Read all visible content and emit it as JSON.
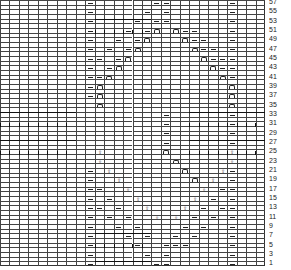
{
  "chart": {
    "columns": 28,
    "rows": 57,
    "row_labels": [
      "1",
      "3",
      "5",
      "7",
      "9",
      "11",
      "13",
      "15",
      "17",
      "19",
      "21",
      "23",
      "25",
      "27",
      "29",
      "31",
      "33",
      "35",
      "37",
      "39",
      "41",
      "43",
      "45",
      "47",
      "49",
      "51",
      "53",
      "55",
      "57"
    ],
    "legend_symbols": {
      "p": "purl-dash",
      "u": "arch-symbol",
      "t": "twist-arrow-symbol",
      "c": "cable-crossing"
    },
    "cells": [
      {
        "r": 57,
        "c": 9,
        "s": "p"
      },
      {
        "r": 57,
        "c": 16,
        "s": "p"
      },
      {
        "r": 57,
        "c": 17,
        "s": "p"
      },
      {
        "r": 57,
        "c": 24,
        "s": "p"
      },
      {
        "r": 55,
        "c": 9,
        "s": "p"
      },
      {
        "r": 55,
        "c": 15,
        "s": "p"
      },
      {
        "r": 55,
        "c": 17,
        "s": "p"
      },
      {
        "r": 55,
        "c": 24,
        "s": "p"
      },
      {
        "r": 53,
        "c": 9,
        "s": "p"
      },
      {
        "r": 53,
        "c": 14,
        "s": "p"
      },
      {
        "r": 53,
        "c": 16,
        "s": "p"
      },
      {
        "r": 53,
        "c": 17,
        "s": "p"
      },
      {
        "r": 53,
        "c": 24,
        "s": "p"
      },
      {
        "r": 51,
        "c": 9,
        "s": "p"
      },
      {
        "r": 51,
        "c": 13,
        "s": "p"
      },
      {
        "r": 51,
        "c": 15,
        "s": "p"
      },
      {
        "r": 51,
        "c": 16,
        "s": "u"
      },
      {
        "r": 51,
        "c": 18,
        "s": "u"
      },
      {
        "r": 51,
        "c": 19,
        "s": "p"
      },
      {
        "r": 51,
        "c": 20,
        "s": "p"
      },
      {
        "r": 51,
        "c": 24,
        "s": "p"
      },
      {
        "r": 49,
        "c": 9,
        "s": "p"
      },
      {
        "r": 49,
        "c": 12,
        "s": "p"
      },
      {
        "r": 49,
        "c": 14,
        "s": "p"
      },
      {
        "r": 49,
        "c": 15,
        "s": "u"
      },
      {
        "r": 49,
        "c": 19,
        "s": "u"
      },
      {
        "r": 49,
        "c": 20,
        "s": "p"
      },
      {
        "r": 49,
        "c": 21,
        "s": "p"
      },
      {
        "r": 49,
        "c": 24,
        "s": "p"
      },
      {
        "r": 47,
        "c": 9,
        "s": "p"
      },
      {
        "r": 47,
        "c": 11,
        "s": "p"
      },
      {
        "r": 47,
        "c": 13,
        "s": "p"
      },
      {
        "r": 47,
        "c": 14,
        "s": "u"
      },
      {
        "r": 47,
        "c": 20,
        "s": "u"
      },
      {
        "r": 47,
        "c": 21,
        "s": "p"
      },
      {
        "r": 47,
        "c": 22,
        "s": "p"
      },
      {
        "r": 47,
        "c": 24,
        "s": "p"
      },
      {
        "r": 45,
        "c": 9,
        "s": "p"
      },
      {
        "r": 45,
        "c": 10,
        "s": "p"
      },
      {
        "r": 45,
        "c": 12,
        "s": "p"
      },
      {
        "r": 45,
        "c": 13,
        "s": "u"
      },
      {
        "r": 45,
        "c": 21,
        "s": "u"
      },
      {
        "r": 45,
        "c": 22,
        "s": "p"
      },
      {
        "r": 45,
        "c": 23,
        "s": "p"
      },
      {
        "r": 45,
        "c": 24,
        "s": "p"
      },
      {
        "r": 43,
        "c": 9,
        "s": "p"
      },
      {
        "r": 43,
        "c": 11,
        "s": "p"
      },
      {
        "r": 43,
        "c": 12,
        "s": "u"
      },
      {
        "r": 43,
        "c": 22,
        "s": "u"
      },
      {
        "r": 43,
        "c": 23,
        "s": "p"
      },
      {
        "r": 43,
        "c": 24,
        "s": "p"
      },
      {
        "r": 41,
        "c": 9,
        "s": "p"
      },
      {
        "r": 41,
        "c": 10,
        "s": "p"
      },
      {
        "r": 41,
        "c": 11,
        "s": "u"
      },
      {
        "r": 41,
        "c": 23,
        "s": "u"
      },
      {
        "r": 41,
        "c": 24,
        "s": "p"
      },
      {
        "r": 39,
        "c": 9,
        "s": "p"
      },
      {
        "r": 39,
        "c": 10,
        "s": "u"
      },
      {
        "r": 39,
        "c": 24,
        "s": "u"
      },
      {
        "r": 37,
        "c": 9,
        "s": "p"
      },
      {
        "r": 37,
        "c": 10,
        "s": "u"
      },
      {
        "r": 37,
        "c": 24,
        "s": "u"
      },
      {
        "r": 35,
        "c": 10,
        "s": "u"
      },
      {
        "r": 35,
        "c": 24,
        "s": "u"
      },
      {
        "r": 33,
        "c": 17,
        "s": "p"
      },
      {
        "r": 33,
        "c": 24,
        "s": "p"
      },
      {
        "r": 31,
        "c": 17,
        "s": "p"
      },
      {
        "r": 31,
        "c": 24,
        "s": "p"
      },
      {
        "r": 29,
        "c": 17,
        "s": "p"
      },
      {
        "r": 29,
        "c": 24,
        "s": "p"
      },
      {
        "r": 27,
        "c": 17,
        "s": "p"
      },
      {
        "r": 27,
        "c": 24,
        "s": "p"
      },
      {
        "r": 25,
        "c": 17,
        "s": "u"
      },
      {
        "r": 25,
        "c": 10,
        "s": "t"
      },
      {
        "r": 25,
        "c": 24,
        "s": "t"
      },
      {
        "r": 23,
        "c": 18,
        "s": "u"
      },
      {
        "r": 23,
        "c": 10,
        "s": "t"
      },
      {
        "r": 23,
        "c": 24,
        "s": "t"
      },
      {
        "r": 21,
        "c": 9,
        "s": "p"
      },
      {
        "r": 21,
        "c": 19,
        "s": "u"
      },
      {
        "r": 21,
        "c": 11,
        "s": "t"
      },
      {
        "r": 21,
        "c": 23,
        "s": "t"
      },
      {
        "r": 21,
        "c": 24,
        "s": "p"
      },
      {
        "r": 19,
        "c": 9,
        "s": "p"
      },
      {
        "r": 19,
        "c": 20,
        "s": "u"
      },
      {
        "r": 19,
        "c": 12,
        "s": "t"
      },
      {
        "r": 19,
        "c": 22,
        "s": "t"
      },
      {
        "r": 19,
        "c": 24,
        "s": "p"
      },
      {
        "r": 17,
        "c": 9,
        "s": "p"
      },
      {
        "r": 17,
        "c": 10,
        "s": "p"
      },
      {
        "r": 17,
        "c": 13,
        "s": "t"
      },
      {
        "r": 17,
        "c": 21,
        "s": "t"
      },
      {
        "r": 17,
        "c": 23,
        "s": "p"
      },
      {
        "r": 17,
        "c": 24,
        "s": "p"
      },
      {
        "r": 15,
        "c": 9,
        "s": "p"
      },
      {
        "r": 15,
        "c": 11,
        "s": "p"
      },
      {
        "r": 15,
        "c": 14,
        "s": "t"
      },
      {
        "r": 15,
        "c": 20,
        "s": "t"
      },
      {
        "r": 15,
        "c": 22,
        "s": "p"
      },
      {
        "r": 15,
        "c": 24,
        "s": "p"
      },
      {
        "r": 13,
        "c": 9,
        "s": "p"
      },
      {
        "r": 13,
        "c": 10,
        "s": "p"
      },
      {
        "r": 13,
        "c": 12,
        "s": "p"
      },
      {
        "r": 13,
        "c": 15,
        "s": "t"
      },
      {
        "r": 13,
        "c": 19,
        "s": "t"
      },
      {
        "r": 13,
        "c": 21,
        "s": "p"
      },
      {
        "r": 13,
        "c": 23,
        "s": "p"
      },
      {
        "r": 13,
        "c": 24,
        "s": "p"
      },
      {
        "r": 11,
        "c": 9,
        "s": "p"
      },
      {
        "r": 11,
        "c": 11,
        "s": "p"
      },
      {
        "r": 11,
        "c": 13,
        "s": "p"
      },
      {
        "r": 11,
        "c": 16,
        "s": "t"
      },
      {
        "r": 11,
        "c": 18,
        "s": "t"
      },
      {
        "r": 11,
        "c": 20,
        "s": "p"
      },
      {
        "r": 11,
        "c": 22,
        "s": "p"
      },
      {
        "r": 11,
        "c": 24,
        "s": "p"
      },
      {
        "r": 9,
        "c": 9,
        "s": "p"
      },
      {
        "r": 9,
        "c": 12,
        "s": "p"
      },
      {
        "r": 9,
        "c": 14,
        "s": "p"
      },
      {
        "r": 9,
        "c": 19,
        "s": "p"
      },
      {
        "r": 9,
        "c": 21,
        "s": "p"
      },
      {
        "r": 9,
        "c": 24,
        "s": "p"
      },
      {
        "r": 7,
        "c": 9,
        "s": "p"
      },
      {
        "r": 7,
        "c": 13,
        "s": "p"
      },
      {
        "r": 7,
        "c": 15,
        "s": "p"
      },
      {
        "r": 7,
        "c": 18,
        "s": "p"
      },
      {
        "r": 7,
        "c": 20,
        "s": "p"
      },
      {
        "r": 7,
        "c": 24,
        "s": "p"
      },
      {
        "r": 5,
        "c": 9,
        "s": "p"
      },
      {
        "r": 5,
        "c": 14,
        "s": "p"
      },
      {
        "r": 5,
        "c": 17,
        "s": "p"
      },
      {
        "r": 5,
        "c": 18,
        "s": "p"
      },
      {
        "r": 5,
        "c": 19,
        "s": "p"
      },
      {
        "r": 5,
        "c": 24,
        "s": "p"
      },
      {
        "r": 3,
        "c": 9,
        "s": "p"
      },
      {
        "r": 3,
        "c": 15,
        "s": "p"
      },
      {
        "r": 3,
        "c": 17,
        "s": "p"
      },
      {
        "r": 3,
        "c": 24,
        "s": "p"
      },
      {
        "r": 1,
        "c": 9,
        "s": "p"
      },
      {
        "r": 1,
        "c": 16,
        "s": "p"
      },
      {
        "r": 1,
        "c": 17,
        "s": "p"
      },
      {
        "r": 1,
        "c": 24,
        "s": "p"
      }
    ],
    "cables": [
      {
        "r": 53,
        "c": 10,
        "w": 6
      },
      {
        "r": 33,
        "c": 0,
        "w": 8
      },
      {
        "r": 33,
        "c": 20,
        "w": 8
      },
      {
        "r": 27,
        "c": 0,
        "w": 8
      },
      {
        "r": 27,
        "c": 20,
        "w": 8
      },
      {
        "r": 7,
        "c": 10,
        "w": 6
      },
      {
        "r": 1,
        "c": 10,
        "w": 6
      }
    ]
  }
}
